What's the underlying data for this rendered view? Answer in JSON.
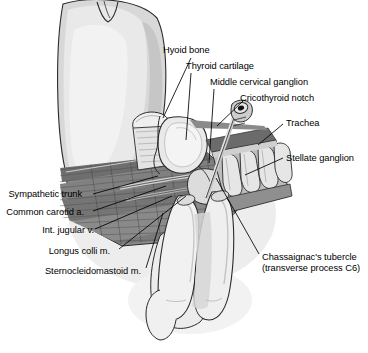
{
  "figure": {
    "background_color": "#ffffff",
    "line_color": "#000000",
    "palette": {
      "outline": "#1a1a1a",
      "skin_light": "#e8e8e8",
      "skin_mid": "#d2d2d2",
      "skin_shadow": "#bdbdbd",
      "cartilage_light": "#f0f0f0",
      "cartilage_mid": "#cfcfcf",
      "muscle_dark": "#6e6e6e",
      "muscle_mid": "#8a8a8a",
      "muscle_light": "#a6a6a6",
      "deep_shadow": "#4a4a4a",
      "vessel_gray": "#9a9a9a",
      "needle_gray": "#b4b4b4",
      "needle_bore": "#111111"
    }
  },
  "labels": [
    {
      "id": "hyoid-bone",
      "text": "Hyoid bone",
      "align": "left",
      "x": 163,
      "y": 45,
      "leader": {
        "x1": 191,
        "y1": 58,
        "x2": 163,
        "y2": 118
      }
    },
    {
      "id": "thyroid-cartilage",
      "text": "Thyroid cartilage",
      "align": "left",
      "x": 186,
      "y": 61,
      "leader": {
        "x1": 191,
        "y1": 73,
        "x2": 186,
        "y2": 140
      }
    },
    {
      "id": "middle-cervical-ganglion",
      "text": "Middle cervical ganglion",
      "align": "left",
      "x": 210,
      "y": 77,
      "leader": {
        "x1": 214,
        "y1": 89,
        "x2": 209,
        "y2": 163
      }
    },
    {
      "id": "cricothyroid-notch",
      "text": "Cricothyroid notch",
      "align": "left",
      "x": 240,
      "y": 93,
      "leader": {
        "x1": 243,
        "y1": 101,
        "x2": 217,
        "y2": 126
      }
    },
    {
      "id": "trachea",
      "text": "Trachea",
      "align": "left",
      "x": 286,
      "y": 118,
      "leader": {
        "x1": 283,
        "y1": 124,
        "x2": 258,
        "y2": 145
      }
    },
    {
      "id": "stellate-ganglion",
      "text": "Stellate ganglion",
      "align": "left",
      "x": 286,
      "y": 153,
      "leader": {
        "x1": 283,
        "y1": 158,
        "x2": 245,
        "y2": 175
      }
    },
    {
      "id": "chassaignacs-tubercle",
      "text": "Chassaignac's tubercle",
      "align": "left",
      "x": 262,
      "y": 252,
      "leader": {
        "x1": 259,
        "y1": 254,
        "x2": 216,
        "y2": 178
      }
    },
    {
      "id": "chassaignacs-tubercle-sub",
      "text": "(transverse process C6)",
      "align": "left",
      "x": 262,
      "y": 263,
      "leader": null
    },
    {
      "id": "sympathetic-trunk",
      "text": "Sympathetic trunk",
      "align": "right",
      "x": 8,
      "y": 189,
      "leader": {
        "x1": 93,
        "y1": 194,
        "x2": 158,
        "y2": 176
      }
    },
    {
      "id": "common-carotid-a",
      "text": "Common carotid a.",
      "align": "right",
      "x": 5,
      "y": 207,
      "leader": {
        "x1": 93,
        "y1": 211,
        "x2": 166,
        "y2": 186
      }
    },
    {
      "id": "int-jugular-v",
      "text": "Int. jugular v.",
      "align": "right",
      "x": 41,
      "y": 225,
      "leader": {
        "x1": 95,
        "y1": 229,
        "x2": 172,
        "y2": 196
      }
    },
    {
      "id": "longus-colli-m",
      "text": "Longus colli m.",
      "align": "right",
      "x": 48,
      "y": 246,
      "leader": {
        "x1": 119,
        "y1": 249,
        "x2": 186,
        "y2": 196
      }
    },
    {
      "id": "sternocleidomastoid-m",
      "text": "Sternocleidomastoid m.",
      "align": "right",
      "x": 44,
      "y": 266,
      "leader": {
        "x1": 146,
        "y1": 268,
        "x2": 163,
        "y2": 213
      }
    }
  ],
  "structures": [
    {
      "id": "head-chin",
      "name": "Head and chin profile"
    },
    {
      "id": "hyoid",
      "name": "Hyoid bone"
    },
    {
      "id": "thyroid-cartilage",
      "name": "Thyroid cartilage"
    },
    {
      "id": "cricoid",
      "name": "Cricoid cartilage"
    },
    {
      "id": "trachea-rings",
      "name": "Tracheal rings"
    },
    {
      "id": "needle",
      "name": "Needle and hub"
    },
    {
      "id": "fingers",
      "name": "Palpating fingers"
    },
    {
      "id": "muscle-field",
      "name": "Cervical muscle field"
    },
    {
      "id": "sympathetic-chain",
      "name": "Cervical sympathetic chain"
    }
  ]
}
